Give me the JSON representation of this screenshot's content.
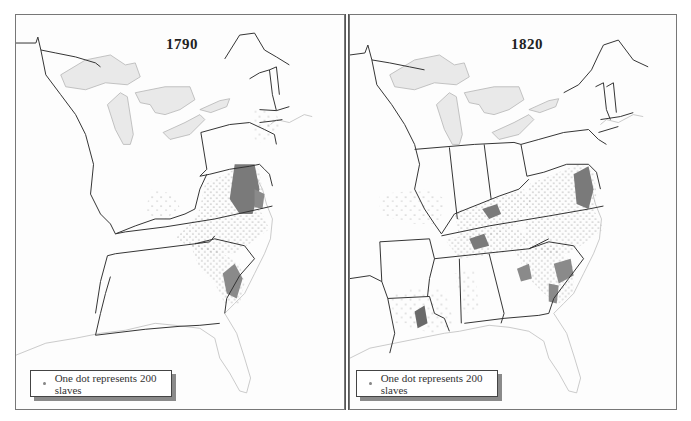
{
  "figure": {
    "panels": [
      {
        "year": "1790",
        "legend": {
          "symbol": "dot-icon",
          "text": "One dot represents 200 slaves"
        },
        "dense_regions": [
          "Tidewater Virginia / Maryland",
          "Coastal South Carolina"
        ],
        "sparse_regions": [
          "Kentucky bluegrass",
          "North Carolina",
          "Piedmont Virginia",
          "New York / New Jersey"
        ]
      },
      {
        "year": "1820",
        "legend": {
          "symbol": "dot-icon",
          "text": "One dot represents 200 slaves"
        },
        "dense_regions": [
          "Virginia",
          "Kentucky bluegrass",
          "Middle Tennessee",
          "Coastal & inland South Carolina",
          "Georgia coast",
          "Lower Mississippi / Louisiana"
        ],
        "sparse_regions": [
          "Missouri",
          "Mississippi",
          "Alabama",
          "Georgia interior",
          "North Carolina"
        ]
      }
    ],
    "colors": {
      "background": "#fdfdfd",
      "state_border": "#333333",
      "lake_fill": "#e9e9e9",
      "lake_stroke": "#b5b5b5",
      "dot": "#777777",
      "dense_fill": "#7a7a7a",
      "coast": "#bdbdbd"
    }
  }
}
